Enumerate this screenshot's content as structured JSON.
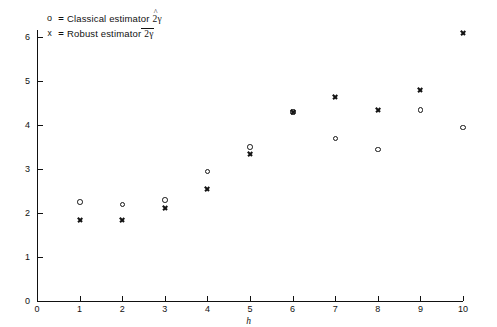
{
  "figure": {
    "width": 497,
    "height": 327,
    "background": "#ffffff",
    "ink_color": "#141414"
  },
  "legend": {
    "position": "top-left",
    "entries": [
      {
        "marker": "circle-marker-icon",
        "marker_glyph": "o",
        "separator": "=",
        "label": "Classical estimator",
        "symbol_base": "2γ",
        "symbol_accent": "hat",
        "symbol_full": "2γ̂"
      },
      {
        "marker": "cross-marker-icon",
        "marker_glyph": "x",
        "separator": "=",
        "label": "Robust estimator",
        "symbol_base": "2γ",
        "symbol_accent": "bar",
        "symbol_full": "2γ̄"
      }
    ]
  },
  "axes": {
    "x": {
      "label": "h",
      "ticks": [
        0,
        1,
        2,
        3,
        4,
        5,
        6,
        7,
        8,
        9,
        10
      ],
      "tick_labels": [
        "0",
        "1",
        "2",
        "3",
        "4",
        "5",
        "6",
        "7",
        "8",
        "9",
        "10"
      ],
      "min": 0,
      "max": 10.2
    },
    "y": {
      "label": "",
      "ticks": [
        0,
        1,
        2,
        3,
        4,
        5,
        6
      ],
      "tick_labels": [
        "0",
        "1",
        "2",
        "3",
        "4",
        "5",
        "6"
      ],
      "min": 0,
      "max": 6.4
    },
    "grid": false
  },
  "chart_data": {
    "type": "scatter",
    "title": "",
    "xlabel": "h",
    "ylabel": "",
    "xlim": [
      0,
      10.2
    ],
    "ylim": [
      0,
      6.4
    ],
    "grid": false,
    "legend_position": "top-left",
    "x": [
      1,
      2,
      3,
      4,
      5,
      6,
      7,
      8,
      9,
      10
    ],
    "series": [
      {
        "name": "Classical estimator 2γ̂",
        "marker": "circle",
        "values": [
          2.25,
          2.2,
          2.3,
          2.95,
          3.5,
          4.3,
          3.7,
          3.45,
          4.35,
          3.95
        ]
      },
      {
        "name": "Robust estimator 2γ̄",
        "marker": "cross",
        "values": [
          1.85,
          1.85,
          2.12,
          2.55,
          3.35,
          4.3,
          4.65,
          4.35,
          4.8,
          6.1
        ]
      }
    ]
  }
}
